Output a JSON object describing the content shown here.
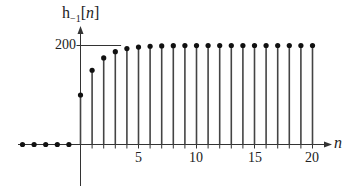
{
  "chart_data": {
    "type": "stem",
    "title": "",
    "ylabel": "h_{-1}[n]",
    "ylabel_display": {
      "main": "h",
      "sub": "−1",
      "open": "[",
      "var": "n",
      "close": "]"
    },
    "xlabel": "n",
    "x_ticks": [
      5,
      10,
      15,
      20
    ],
    "x_tick_labels": [
      "5",
      "10",
      "15",
      "20"
    ],
    "y_ticks": [
      200
    ],
    "y_tick_labels": [
      "200"
    ],
    "xlim": [
      -5,
      20
    ],
    "ylim": [
      0,
      200
    ],
    "grid": false,
    "reference_line": {
      "y": 200,
      "from_x": 0,
      "to_x": 3.5
    },
    "x": [
      -5,
      -4,
      -3,
      -2,
      -1,
      0,
      1,
      2,
      3,
      4,
      5,
      6,
      7,
      8,
      9,
      10,
      11,
      12,
      13,
      14,
      15,
      16,
      17,
      18,
      19,
      20
    ],
    "values": [
      0,
      0,
      0,
      0,
      0,
      100,
      150,
      175,
      187.5,
      193.75,
      196.88,
      198.44,
      199.22,
      199.61,
      199.8,
      199.9,
      199.95,
      199.98,
      199.99,
      199.99,
      200,
      200,
      200,
      200,
      200,
      200
    ]
  },
  "colors": {
    "stem": "#444444",
    "dot": "#111111",
    "axis": "#333333",
    "text": "#222222"
  }
}
